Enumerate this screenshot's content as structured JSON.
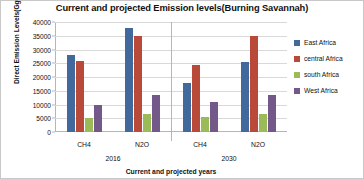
{
  "chart_data": {
    "type": "bar",
    "title": "Current and projected Emission levels(Burning Savannah)",
    "xlabel": "Current and projected years",
    "ylabel": "Direct Emission Levels(GgCO2e)",
    "ylim": [
      0,
      40000
    ],
    "ytick_step": 5000,
    "yticks": [
      "40000",
      "35000",
      "30000",
      "25000",
      "20000",
      "15000",
      "10000",
      "5000",
      "0"
    ],
    "grid": true,
    "legend_position": "right",
    "group_labels": [
      "2016",
      "2030"
    ],
    "categories": [
      "CH4",
      "N2O",
      "CH4",
      "N2O"
    ],
    "groups": [
      {
        "year": "2016",
        "categories": [
          "CH4",
          "N2O"
        ]
      },
      {
        "year": "2030",
        "categories": [
          "CH4",
          "N2O"
        ]
      }
    ],
    "series": [
      {
        "name": "East Africa",
        "color": "#41699B",
        "values": [
          28000,
          38000,
          18000,
          25500
        ]
      },
      {
        "name": "central Africa",
        "color": "#B94A3A",
        "values": [
          26000,
          35000,
          24500,
          35000
        ]
      },
      {
        "name": "south Africa",
        "color": "#9BBB59",
        "values": [
          5000,
          6500,
          5500,
          6500
        ]
      },
      {
        "name": "West Africa",
        "color": "#72598A",
        "values": [
          10000,
          13500,
          11000,
          13500
        ]
      }
    ]
  }
}
